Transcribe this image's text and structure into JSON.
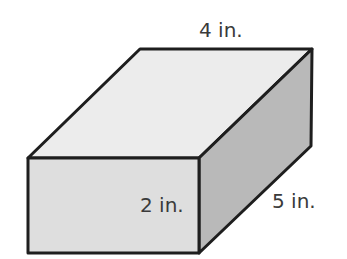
{
  "diagram": {
    "type": "rectangular-prism",
    "dimensions": {
      "length": {
        "value": 4,
        "unit": "in.",
        "label": "4 in."
      },
      "height": {
        "value": 2,
        "unit": "in.",
        "label": "2 in."
      },
      "width": {
        "value": 5,
        "unit": "in.",
        "label": "5 in."
      }
    },
    "colors": {
      "top_face": "#ececec",
      "front_face": "#dedede",
      "side_face": "#b9b9b9",
      "edge": "#1e1e1e",
      "label_text": "#3a3a3a"
    }
  }
}
